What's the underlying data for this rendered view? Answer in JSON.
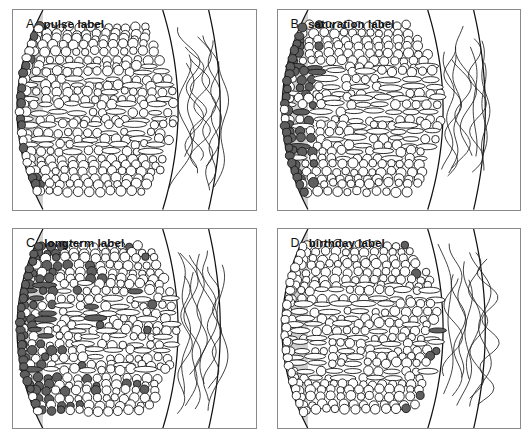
{
  "figure": {
    "panel_count": 4,
    "layout": "2x2 grid",
    "colors": {
      "tissue_fill": "#d2d2d2",
      "lumen_fill": "#ffffff",
      "outer_fill": "#ffffff",
      "cell_outline": "#1a1a1a",
      "cell_unlabeled_fill": "#ffffff",
      "cell_labeled_fill": "#5f5f5f",
      "boundary_line": "#111111",
      "fiber_line": "#222222",
      "panel_border": "#8a8a8a",
      "page_background": "#ffffff"
    },
    "legend_note": "Open circles = unlabeled cells; filled gray circles = labeled cells"
  },
  "panels": [
    {
      "id": "panel-a",
      "letter": "A",
      "label": "pulse label",
      "labeled_zone": "basal (left) edge, sparse single file",
      "labeled_cell_count": 17
    },
    {
      "id": "panel-b",
      "letter": "B",
      "label": "saturation label",
      "labeled_zone": "basal (left) edge, dense multi-row band",
      "labeled_cell_count": 38
    },
    {
      "id": "panel-c",
      "letter": "C",
      "label": "longterm label",
      "labeled_zone": "basal edge plus scattered through mid zone and apical edge",
      "labeled_cell_count": 58
    },
    {
      "id": "panel-d",
      "letter": "D",
      "label": "birthday label",
      "labeled_zone": "apical (right) edge only, sparse column",
      "labeled_cell_count": 9
    }
  ],
  "chart_data": {
    "type": "diagram",
    "panels": [
      {
        "letter": "A",
        "label": "pulse label",
        "labeled_cells": 17,
        "zone": "basal"
      },
      {
        "letter": "B",
        "label": "saturation label",
        "labeled_cells": 38,
        "zone": "basal"
      },
      {
        "letter": "C",
        "label": "longterm label",
        "labeled_cells": 58,
        "zone": "basal+mid+apical"
      },
      {
        "letter": "D",
        "label": "birthday label",
        "labeled_cells": 9,
        "zone": "apical"
      }
    ]
  }
}
